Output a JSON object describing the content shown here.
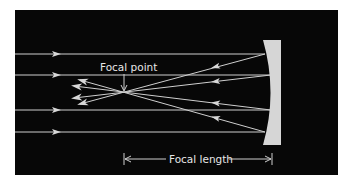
{
  "diagram": {
    "colors": {
      "background": "#070707",
      "ray": "#d4d4d4",
      "mirror": "#d6d6d6",
      "text": "#e6e6e6"
    },
    "labels": {
      "focal_point": "Focal point",
      "focal_length": "Focal length"
    },
    "focal_point": {
      "x": 124,
      "y": 92
    },
    "mirror": {
      "top": 40,
      "bottom": 145,
      "left_edge_top": 263,
      "left_edge_mid": 273,
      "right_edge": 281
    },
    "incoming_rays_y": [
      54,
      75,
      110,
      132
    ],
    "reflected_rays_start": [
      {
        "x": 265,
        "y": 54
      },
      {
        "x": 271,
        "y": 75
      },
      {
        "x": 271,
        "y": 110
      },
      {
        "x": 265,
        "y": 132
      }
    ],
    "focal_length_span": {
      "x_start": 123,
      "x_end": 272,
      "y": 159
    }
  }
}
